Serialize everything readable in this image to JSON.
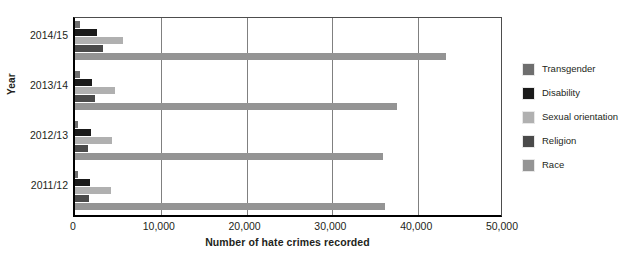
{
  "chart_data": {
    "type": "bar",
    "orientation": "horizontal",
    "title": "",
    "xlabel": "Number of hate crimes recorded",
    "ylabel": "Year",
    "categories": [
      "2014/15",
      "2013/14",
      "2012/13",
      "2011/12"
    ],
    "xlim": [
      0,
      50000
    ],
    "xticks": [
      0,
      10000,
      20000,
      30000,
      40000,
      50000
    ],
    "xtick_labels": [
      "0",
      "10,000",
      "20,000",
      "30,000",
      "40,000",
      "50,000"
    ],
    "grid": true,
    "grid_axis": "x",
    "legend_position": "right",
    "series": [
      {
        "name": "Transgender",
        "color": "#6e6e6e",
        "values": [
          605,
          555,
          360,
          315
        ]
      },
      {
        "name": "Disability",
        "color": "#1a1a1a",
        "values": [
          2508,
          1985,
          1841,
          1748
        ]
      },
      {
        "name": "Sexual orientation",
        "color": "#b0b0b0",
        "values": [
          5597,
          4622,
          4267,
          4252
        ]
      },
      {
        "name": "Religion",
        "color": "#4a4a4a",
        "values": [
          3254,
          2273,
          1572,
          1621
        ]
      },
      {
        "name": "Race",
        "color": "#949494",
        "values": [
          43212,
          37484,
          35889,
          36100
        ]
      }
    ]
  },
  "axes": {
    "y_title": "Year",
    "x_title": "Number of hate crimes recorded"
  }
}
